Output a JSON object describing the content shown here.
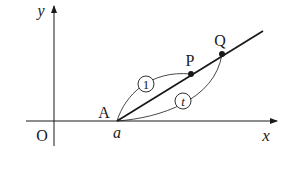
{
  "diagram": {
    "axes": {
      "x_label": "x",
      "y_label": "y",
      "origin_label": "O"
    },
    "points": {
      "A": {
        "label": "A",
        "x_value_label": "a"
      },
      "P": {
        "label": "P"
      },
      "Q": {
        "label": "Q"
      }
    },
    "arcs": [
      {
        "from": "A",
        "to": "P",
        "label": "1",
        "style": "circled"
      },
      {
        "from": "A",
        "to": "Q",
        "label": "t",
        "style": "circled"
      }
    ],
    "colors": {
      "ink": "#1a1a1a",
      "background": "#ffffff"
    }
  }
}
